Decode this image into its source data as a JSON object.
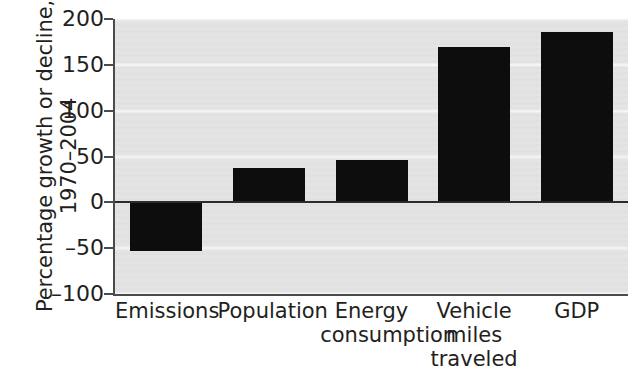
{
  "chart_data": {
    "type": "bar",
    "title": "",
    "subtitle": "",
    "xlabel": "",
    "ylabel": "Percentage growth or decline, 1970–2004",
    "ylabel_lines": [
      "Percentage growth or decline,",
      "1970–2004"
    ],
    "categories": [
      "Emissions",
      "Population",
      "Energy\nconsumption",
      "Vehicle\nmiles\ntraveled",
      "GDP"
    ],
    "values": [
      -53,
      38,
      46,
      170,
      186
    ],
    "ylim": [
      -100,
      200
    ],
    "yticks": [
      200,
      150,
      100,
      50,
      0,
      -50,
      -100
    ],
    "ytick_labels": [
      "200",
      "150",
      "100",
      "50",
      "0",
      "–50",
      "–100"
    ],
    "grid": "horizontal",
    "legend": "none",
    "bar_color": "#0d0d0d",
    "plot_background": "#e4e4e4",
    "gridline_color": "#f4f4f4",
    "axis_color": "#4b4b4b",
    "zero_line_color": "#2b2b2b"
  }
}
